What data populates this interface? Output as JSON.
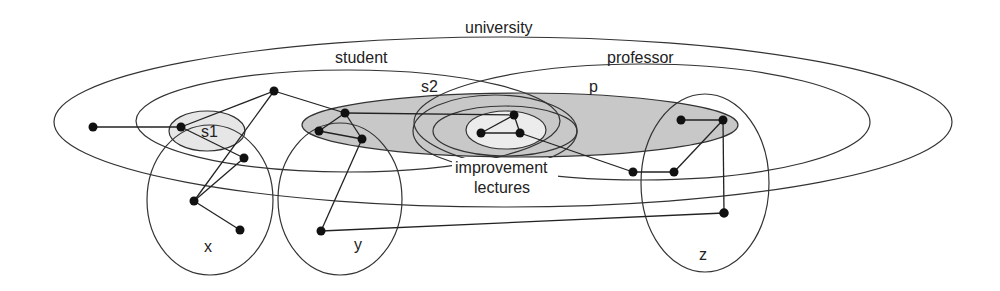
{
  "diagram": {
    "type": "hypergraph-venn",
    "colors": {
      "outline": "#333333",
      "shaded_dark": "#c8c8c8",
      "shaded_light": "#e6e6e6",
      "node": "#111111",
      "background": "#ffffff"
    },
    "labels": {
      "university": "university",
      "student": "student",
      "professor": "professor",
      "s1": "s1",
      "s2": "s2",
      "p": "p",
      "improvement": "improvement",
      "lectures": "lectures",
      "x": "x",
      "y": "y",
      "z": "z"
    },
    "regions": [
      {
        "id": "university",
        "cx": 503,
        "cy": 122,
        "rx": 449,
        "ry": 85,
        "fill": "none"
      },
      {
        "id": "student",
        "cx": 348,
        "cy": 120,
        "rx": 212,
        "ry": 52,
        "fill": "none"
      },
      {
        "id": "professor",
        "cx": 642,
        "cy": 122,
        "rx": 228,
        "ry": 58,
        "fill": "none"
      },
      {
        "id": "s1",
        "cx": 207,
        "cy": 131,
        "rx": 38,
        "ry": 20,
        "fill": "light"
      },
      {
        "id": "shaded-band",
        "cx": 520,
        "cy": 125,
        "rx": 218,
        "ry": 32,
        "fill": "dark"
      },
      {
        "id": "s2",
        "cx": 495,
        "cy": 131,
        "rx": 82,
        "ry": 36,
        "fill": "none"
      },
      {
        "id": "p",
        "cx": 505,
        "cy": 131,
        "rx": 72,
        "ry": 25,
        "fill": "none"
      },
      {
        "id": "inner",
        "cx": 506,
        "cy": 130,
        "rx": 40,
        "ry": 19,
        "fill": "light"
      },
      {
        "id": "x",
        "cx": 210,
        "cy": 200,
        "rx": 63,
        "ry": 75,
        "fill": "none"
      },
      {
        "id": "y",
        "cx": 340,
        "cy": 199,
        "rx": 62,
        "ry": 76,
        "fill": "none"
      },
      {
        "id": "z",
        "cx": 705,
        "cy": 183,
        "rx": 64,
        "ry": 89,
        "fill": "none"
      }
    ],
    "nodes": [
      {
        "id": "n1",
        "x": 93,
        "y": 127
      },
      {
        "id": "n2",
        "x": 181,
        "y": 127
      },
      {
        "id": "n3",
        "x": 274,
        "y": 91
      },
      {
        "id": "n4",
        "x": 244,
        "y": 158
      },
      {
        "id": "n5",
        "x": 194,
        "y": 201
      },
      {
        "id": "n6",
        "x": 240,
        "y": 230
      },
      {
        "id": "n7",
        "x": 345,
        "y": 113
      },
      {
        "id": "n8",
        "x": 319,
        "y": 131
      },
      {
        "id": "n9",
        "x": 362,
        "y": 139
      },
      {
        "id": "n10",
        "x": 321,
        "y": 231
      },
      {
        "id": "n11",
        "x": 514,
        "y": 115
      },
      {
        "id": "n12",
        "x": 481,
        "y": 133
      },
      {
        "id": "n13",
        "x": 520,
        "y": 133
      },
      {
        "id": "n14",
        "x": 633,
        "y": 172
      },
      {
        "id": "n15",
        "x": 674,
        "y": 172
      },
      {
        "id": "n16",
        "x": 681,
        "y": 120
      },
      {
        "id": "n17",
        "x": 723,
        "y": 120
      },
      {
        "id": "n18",
        "x": 724,
        "y": 213
      }
    ],
    "edges": [
      [
        "n1",
        "n2"
      ],
      [
        "n2",
        "n3"
      ],
      [
        "n2",
        "n4"
      ],
      [
        "n3",
        "n5"
      ],
      [
        "n4",
        "n5"
      ],
      [
        "n5",
        "n6"
      ],
      [
        "n3",
        "n7"
      ],
      [
        "n7",
        "n8"
      ],
      [
        "n8",
        "n9"
      ],
      [
        "n7",
        "n9"
      ],
      [
        "n9",
        "n10"
      ],
      [
        "n7",
        "n11"
      ],
      [
        "n11",
        "n12"
      ],
      [
        "n12",
        "n13"
      ],
      [
        "n11",
        "n13"
      ],
      [
        "n13",
        "n14"
      ],
      [
        "n14",
        "n15"
      ],
      [
        "n15",
        "n17"
      ],
      [
        "n16",
        "n17"
      ],
      [
        "n17",
        "n18"
      ],
      [
        "n10",
        "n18"
      ]
    ]
  }
}
